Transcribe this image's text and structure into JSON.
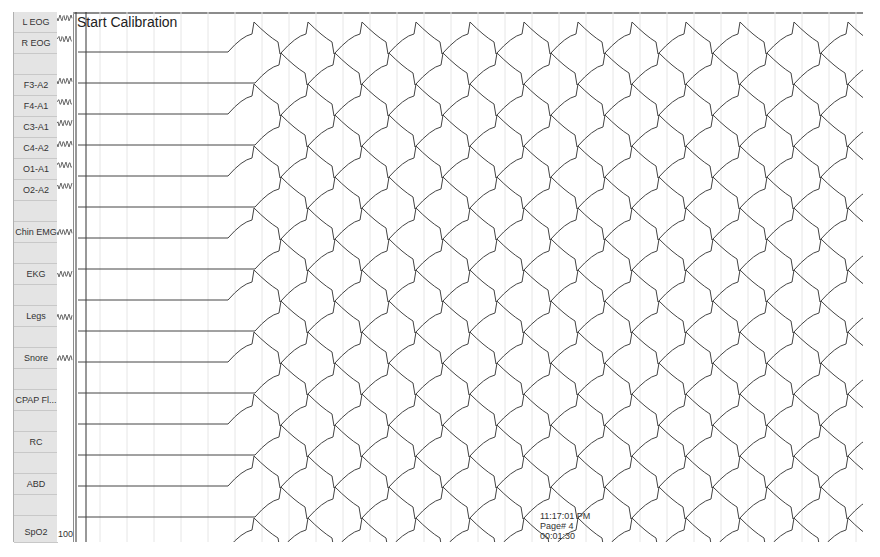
{
  "title": "Start Calibration",
  "channels": [
    {
      "label": "L EOG",
      "top": 0
    },
    {
      "label": "R EOG",
      "top": 21
    },
    {
      "label": "",
      "top": 42
    },
    {
      "label": "F3-A2",
      "top": 63
    },
    {
      "label": "F4-A1",
      "top": 84
    },
    {
      "label": "C3-A1",
      "top": 105
    },
    {
      "label": "C4-A2",
      "top": 126
    },
    {
      "label": "O1-A1",
      "top": 147
    },
    {
      "label": "O2-A2",
      "top": 168
    },
    {
      "label": "",
      "top": 189
    },
    {
      "label": "Chin EMG",
      "top": 210
    },
    {
      "label": "",
      "top": 231
    },
    {
      "label": "EKG",
      "top": 252
    },
    {
      "label": "",
      "top": 273
    },
    {
      "label": "Legs",
      "top": 294
    },
    {
      "label": "",
      "top": 315
    },
    {
      "label": "Snore",
      "top": 336
    },
    {
      "label": "",
      "top": 357
    },
    {
      "label": "CPAP Fl...",
      "top": 378
    },
    {
      "label": "",
      "top": 399
    },
    {
      "label": "RC",
      "top": 420
    },
    {
      "label": "",
      "top": 441
    },
    {
      "label": "ABD",
      "top": 462
    },
    {
      "label": "",
      "top": 483
    },
    {
      "label": "SpO2",
      "top": 510
    }
  ],
  "spo2_scale": "100",
  "footer": {
    "time": "11:17:01 PM",
    "page": "Page# 4",
    "elapsed": "00:01:30"
  },
  "colors": {
    "trace": "#444444",
    "grid": "#e6e6e6",
    "label_bg": "#e4e4e4"
  }
}
